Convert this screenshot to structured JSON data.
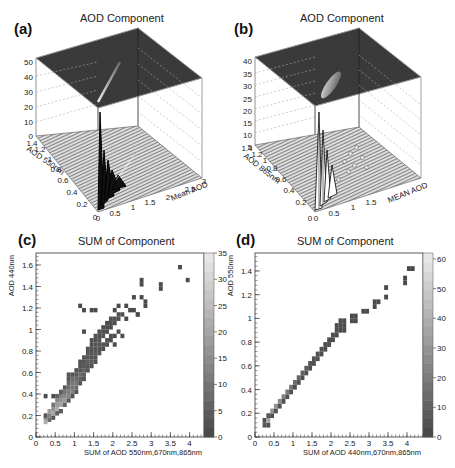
{
  "figure": {
    "panels": [
      {
        "id": "a",
        "label": "(a)",
        "title": "AOD Component"
      },
      {
        "id": "b",
        "label": "(b)",
        "title": "AOD Component"
      },
      {
        "id": "c",
        "label": "(c)",
        "title": "SUM of Component"
      },
      {
        "id": "d",
        "label": "(d)",
        "title": "SUM of Component"
      }
    ]
  },
  "chart_data": [
    {
      "id": "a",
      "type": "surface3d",
      "title": "AOD Component",
      "xlabel": "Mean AOD",
      "ylabel": "AOD 550nm",
      "zlabel": "",
      "x_ticks": [
        "0",
        "0.5",
        "1",
        "1.5",
        "2",
        "2.5",
        "3"
      ],
      "y_ticks": [
        "0",
        "0.2",
        "0.4",
        "0.6",
        "0.8",
        "1",
        "1.2",
        "1.4"
      ],
      "z_ticks": [
        "0",
        "10",
        "20",
        "30",
        "40",
        "50",
        "60"
      ],
      "xlim": [
        0,
        3
      ],
      "ylim": [
        0,
        1.4
      ],
      "zlim": [
        0,
        65
      ],
      "description": "Lego/surface histogram with sharp peak (~35) near Mean AOD 0.1-0.3, AOD 550nm 0.1-0.3, decaying along diagonal; top color plane shows projected diagonal streak"
    },
    {
      "id": "b",
      "type": "surface3d",
      "title": "AOD Component",
      "xlabel": "MEAN AOD",
      "ylabel": "AOD 865nm",
      "zlabel": "",
      "x_ticks": [
        "0",
        "0.5",
        "1",
        "1.5",
        "2",
        "2.5",
        "3"
      ],
      "y_ticks": [
        "0",
        "0.2",
        "0.4",
        "0.6",
        "0.8",
        "1",
        "1.2",
        "1.4"
      ],
      "z_ticks": [
        "5",
        "10",
        "15",
        "20",
        "25",
        "30",
        "35",
        "40"
      ],
      "xlim": [
        0,
        3
      ],
      "ylim": [
        0,
        1.4
      ],
      "zlim": [
        0,
        42
      ],
      "description": "Surface histogram with sharp peaks (~25) near Mean AOD 0.1-0.3 at low AOD 865nm, scattered smaller bins along diagonal"
    },
    {
      "id": "c",
      "type": "heatmap",
      "title": "SUM of Component",
      "xlabel": "SUM of AOD 550nm,670nm,865nm",
      "ylabel": "AOD 440nm",
      "x_ticks": [
        "0",
        "0.5",
        "1",
        "1.5",
        "2",
        "2.5",
        "3",
        "3.5",
        "4"
      ],
      "y_ticks": [
        "0",
        "0.2",
        "0.4",
        "0.6",
        "0.8",
        "1",
        "1.2",
        "1.4",
        "1.6"
      ],
      "colorbar_ticks": [
        "0",
        "5",
        "10",
        "15",
        "20",
        "25",
        "30",
        "35"
      ],
      "xlim": [
        0,
        4.4
      ],
      "ylim": [
        0,
        1.7
      ],
      "zlim": [
        0,
        35
      ],
      "cells": [
        [
          0.25,
          0.14,
          22
        ],
        [
          0.25,
          0.18,
          14
        ],
        [
          0.25,
          0.2,
          4
        ],
        [
          0.35,
          0.2,
          12
        ],
        [
          0.35,
          0.24,
          18
        ],
        [
          0.35,
          0.16,
          8
        ],
        [
          0.45,
          0.18,
          3
        ],
        [
          0.45,
          0.22,
          20
        ],
        [
          0.45,
          0.26,
          16
        ],
        [
          0.45,
          0.3,
          10
        ],
        [
          0.55,
          0.26,
          22
        ],
        [
          0.55,
          0.3,
          18
        ],
        [
          0.55,
          0.34,
          14
        ],
        [
          0.55,
          0.38,
          6
        ],
        [
          0.55,
          0.22,
          5
        ],
        [
          0.65,
          0.24,
          4
        ],
        [
          0.65,
          0.3,
          20
        ],
        [
          0.65,
          0.34,
          16
        ],
        [
          0.65,
          0.38,
          12
        ],
        [
          0.65,
          0.42,
          5
        ],
        [
          0.75,
          0.3,
          6
        ],
        [
          0.75,
          0.34,
          18
        ],
        [
          0.75,
          0.38,
          14
        ],
        [
          0.75,
          0.42,
          10
        ],
        [
          0.75,
          0.46,
          4
        ],
        [
          0.85,
          0.34,
          4
        ],
        [
          0.85,
          0.38,
          14
        ],
        [
          0.85,
          0.42,
          12
        ],
        [
          0.85,
          0.46,
          8
        ],
        [
          0.85,
          0.5,
          6
        ],
        [
          0.85,
          0.54,
          3
        ],
        [
          0.85,
          0.58,
          3
        ],
        [
          0.95,
          0.38,
          3
        ],
        [
          0.95,
          0.42,
          12
        ],
        [
          0.95,
          0.46,
          10
        ],
        [
          0.95,
          0.5,
          10
        ],
        [
          0.95,
          0.54,
          8
        ],
        [
          0.95,
          0.58,
          3
        ],
        [
          1.05,
          0.42,
          3
        ],
        [
          1.05,
          0.46,
          8
        ],
        [
          1.05,
          0.5,
          10
        ],
        [
          1.05,
          0.54,
          8
        ],
        [
          1.05,
          0.58,
          4
        ],
        [
          1.05,
          0.62,
          3
        ],
        [
          1.15,
          0.5,
          4
        ],
        [
          1.15,
          0.54,
          6
        ],
        [
          1.15,
          0.58,
          8
        ],
        [
          1.15,
          0.62,
          4
        ],
        [
          1.15,
          0.66,
          3
        ],
        [
          1.15,
          0.7,
          3
        ],
        [
          1.25,
          0.54,
          3
        ],
        [
          1.25,
          0.58,
          5
        ],
        [
          1.25,
          0.62,
          6
        ],
        [
          1.25,
          0.66,
          4
        ],
        [
          1.25,
          0.7,
          3
        ],
        [
          1.25,
          0.74,
          3
        ],
        [
          1.35,
          0.62,
          3
        ],
        [
          1.35,
          0.66,
          4
        ],
        [
          1.35,
          0.7,
          5
        ],
        [
          1.35,
          0.74,
          3
        ],
        [
          1.35,
          0.78,
          3
        ],
        [
          1.35,
          0.82,
          3
        ],
        [
          1.45,
          0.66,
          3
        ],
        [
          1.45,
          0.7,
          4
        ],
        [
          1.45,
          0.74,
          3
        ],
        [
          1.45,
          0.78,
          3
        ],
        [
          1.45,
          0.82,
          3
        ],
        [
          1.45,
          0.86,
          2
        ],
        [
          1.45,
          0.9,
          2
        ],
        [
          1.55,
          0.7,
          2
        ],
        [
          1.55,
          0.74,
          3
        ],
        [
          1.55,
          0.78,
          4
        ],
        [
          1.55,
          0.82,
          3
        ],
        [
          1.55,
          0.86,
          3
        ],
        [
          1.55,
          0.9,
          2
        ],
        [
          1.55,
          0.94,
          2
        ],
        [
          1.65,
          0.78,
          3
        ],
        [
          1.65,
          0.82,
          3
        ],
        [
          1.65,
          0.86,
          3
        ],
        [
          1.65,
          0.9,
          3
        ],
        [
          1.65,
          0.94,
          2
        ],
        [
          1.65,
          0.98,
          2
        ],
        [
          1.75,
          0.82,
          2
        ],
        [
          1.75,
          0.86,
          3
        ],
        [
          1.75,
          0.94,
          3
        ],
        [
          1.75,
          0.98,
          2
        ],
        [
          1.75,
          1.02,
          2
        ],
        [
          1.85,
          0.86,
          2
        ],
        [
          1.85,
          0.9,
          3
        ],
        [
          1.85,
          0.98,
          2
        ],
        [
          1.85,
          1.02,
          2
        ],
        [
          1.85,
          1.06,
          2
        ],
        [
          1.95,
          0.9,
          2
        ],
        [
          1.95,
          0.94,
          2
        ],
        [
          1.95,
          1.02,
          2
        ],
        [
          1.95,
          1.06,
          2
        ],
        [
          1.95,
          1.1,
          2
        ],
        [
          2.05,
          0.86,
          1
        ],
        [
          2.05,
          0.94,
          2
        ],
        [
          2.05,
          1.06,
          2
        ],
        [
          2.05,
          1.1,
          2
        ],
        [
          2.15,
          0.98,
          2
        ],
        [
          2.15,
          1.1,
          2
        ],
        [
          2.15,
          1.14,
          2
        ],
        [
          2.25,
          0.94,
          1
        ],
        [
          2.25,
          1.14,
          2
        ],
        [
          0.25,
          0.38,
          1
        ],
        [
          0.45,
          0.38,
          1
        ],
        [
          1.25,
          0.98,
          1
        ],
        [
          1.45,
          1.18,
          1
        ],
        [
          1.15,
          1.22,
          1
        ],
        [
          1.25,
          1.18,
          1
        ],
        [
          1.55,
          1.18,
          1
        ],
        [
          2.05,
          1.18,
          1
        ],
        [
          2.15,
          1.22,
          1
        ],
        [
          2.35,
          1.22,
          1
        ],
        [
          2.45,
          1.18,
          1
        ],
        [
          2.55,
          1.18,
          1
        ],
        [
          2.65,
          1.14,
          1
        ],
        [
          2.55,
          1.3,
          1
        ],
        [
          2.75,
          1.3,
          1
        ],
        [
          2.85,
          1.26,
          1
        ],
        [
          2.85,
          1.22,
          1
        ],
        [
          2.75,
          1.42,
          1
        ],
        [
          2.75,
          1.46,
          1
        ],
        [
          3.25,
          1.38,
          1
        ],
        [
          3.25,
          1.42,
          1
        ],
        [
          3.75,
          1.58,
          1
        ],
        [
          3.95,
          1.46,
          1
        ],
        [
          2.65,
          1.14,
          1
        ],
        [
          2.35,
          1.1,
          1
        ]
      ]
    },
    {
      "id": "d",
      "type": "heatmap",
      "title": "SUM of Component",
      "xlabel": "SUM of AOD 440nm,670nm,865nm",
      "ylabel": "AOD 550nm",
      "x_ticks": [
        "0",
        "0.5",
        "1",
        "1.5",
        "2",
        "2.5",
        "3",
        "3.5",
        "4"
      ],
      "y_ticks": [
        "0",
        "0.2",
        "0.4",
        "0.6",
        "0.8",
        "1",
        "1.2",
        "1.4"
      ],
      "colorbar_ticks": [
        "0",
        "10",
        "20",
        "30",
        "40",
        "50",
        "60"
      ],
      "xlim": [
        0,
        4.4
      ],
      "ylim": [
        0,
        1.55
      ],
      "zlim": [
        0,
        62
      ],
      "cells": [
        [
          0.25,
          0.1,
          6
        ],
        [
          0.35,
          0.1,
          4
        ],
        [
          0.25,
          0.14,
          4
        ],
        [
          0.35,
          0.14,
          35
        ],
        [
          0.35,
          0.18,
          6
        ],
        [
          0.45,
          0.18,
          4
        ],
        [
          0.45,
          0.22,
          30
        ],
        [
          0.55,
          0.22,
          4
        ],
        [
          0.55,
          0.26,
          28
        ],
        [
          0.65,
          0.26,
          4
        ],
        [
          0.65,
          0.3,
          26
        ],
        [
          0.75,
          0.3,
          4
        ],
        [
          0.75,
          0.34,
          22
        ],
        [
          0.85,
          0.34,
          4
        ],
        [
          0.85,
          0.38,
          20
        ],
        [
          0.95,
          0.38,
          4
        ],
        [
          0.95,
          0.42,
          18
        ],
        [
          1.05,
          0.42,
          4
        ],
        [
          1.05,
          0.46,
          14
        ],
        [
          1.15,
          0.46,
          4
        ],
        [
          1.15,
          0.5,
          12
        ],
        [
          1.25,
          0.5,
          4
        ],
        [
          1.25,
          0.54,
          10
        ],
        [
          1.35,
          0.54,
          4
        ],
        [
          1.35,
          0.58,
          8
        ],
        [
          1.45,
          0.58,
          4
        ],
        [
          1.45,
          0.62,
          6
        ],
        [
          1.55,
          0.62,
          4
        ],
        [
          1.55,
          0.66,
          5
        ],
        [
          1.65,
          0.66,
          4
        ],
        [
          1.65,
          0.7,
          4
        ],
        [
          1.75,
          0.7,
          3
        ],
        [
          1.75,
          0.74,
          4
        ],
        [
          1.85,
          0.74,
          3
        ],
        [
          1.85,
          0.78,
          3
        ],
        [
          1.95,
          0.78,
          3
        ],
        [
          1.95,
          0.82,
          3
        ],
        [
          2.05,
          0.82,
          2
        ],
        [
          2.05,
          0.86,
          3
        ],
        [
          2.15,
          0.86,
          2
        ],
        [
          2.15,
          0.9,
          3
        ],
        [
          2.25,
          0.9,
          2
        ],
        [
          2.25,
          0.94,
          2
        ],
        [
          2.25,
          0.98,
          2
        ],
        [
          2.35,
          0.9,
          2
        ],
        [
          2.35,
          0.94,
          2
        ],
        [
          2.35,
          0.98,
          2
        ],
        [
          2.15,
          0.94,
          2
        ],
        [
          2.55,
          0.98,
          2
        ],
        [
          2.55,
          1.02,
          2
        ],
        [
          2.65,
          1.02,
          2
        ],
        [
          2.65,
          0.98,
          2
        ],
        [
          2.85,
          1.06,
          2
        ],
        [
          2.95,
          1.06,
          2
        ],
        [
          3.15,
          1.1,
          2
        ],
        [
          3.15,
          1.14,
          2
        ],
        [
          3.25,
          1.14,
          2
        ],
        [
          3.45,
          1.18,
          1
        ],
        [
          3.45,
          1.26,
          1
        ],
        [
          3.95,
          1.3,
          1
        ],
        [
          3.95,
          1.34,
          1
        ],
        [
          4.05,
          1.42,
          1
        ],
        [
          4.15,
          1.42,
          1
        ]
      ]
    }
  ]
}
